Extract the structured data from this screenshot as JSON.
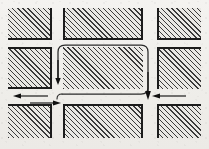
{
  "diagram": {
    "canvas": {
      "width": 209,
      "height": 149,
      "background_color": "#f1efec"
    },
    "style": {
      "hatch_color": "#3a3a3a",
      "block_fill_color": "#e9e8e4",
      "edge_color": "#1c1c1c",
      "path_color": "#2a2a2a",
      "hatch_angle_degrees": 45
    },
    "blocks": [
      {
        "id": "block-top-left",
        "label": "Top Left Block",
        "x": 8,
        "y": 8,
        "w": 44,
        "h": 32,
        "shadow_edges": "right-bottom"
      },
      {
        "id": "block-top-center",
        "label": "Top Center Block",
        "x": 63,
        "y": 8,
        "w": 80,
        "h": 32,
        "shadow_edges": "left-right-bottom"
      },
      {
        "id": "block-top-right",
        "label": "Top Right Block",
        "x": 157,
        "y": 8,
        "w": 44,
        "h": 32,
        "shadow_edges": "left-bottom"
      },
      {
        "id": "block-mid-left",
        "label": "Middle Left Block",
        "x": 8,
        "y": 47,
        "w": 44,
        "h": 42,
        "shadow_edges": "top-right-bottom"
      },
      {
        "id": "block-mid-center",
        "label": "Center Block",
        "x": 63,
        "y": 47,
        "w": 80,
        "h": 42,
        "shadow_edges": "none"
      },
      {
        "id": "block-mid-right",
        "label": "Middle Right Block",
        "x": 157,
        "y": 47,
        "w": 44,
        "h": 42,
        "shadow_edges": "left-top"
      },
      {
        "id": "block-bottom-left",
        "label": "Bottom Left Block",
        "x": 8,
        "y": 104,
        "w": 44,
        "h": 34,
        "shadow_edges": "top-right"
      },
      {
        "id": "block-bottom-center",
        "label": "Bottom Center Block",
        "x": 63,
        "y": 104,
        "w": 80,
        "h": 34,
        "shadow_edges": "left-top-right"
      },
      {
        "id": "block-bottom-right",
        "label": "Bottom Right Block",
        "x": 157,
        "y": 104,
        "w": 44,
        "h": 34,
        "shadow_edges": "left-top"
      }
    ],
    "loop_path": {
      "id": "routing-loop",
      "label": "Routing loop around centre block",
      "corner_radius": 7,
      "stroke_width": 1.3,
      "points_description": "Starts left of centre block, runs up, across the top, down the right side and back along the bottom."
    },
    "arrows": [
      {
        "id": "arrow-loop-down-left",
        "label": "Loop arrow pointing down (left side of centre block)",
        "direction": "down",
        "x": 58,
        "y": 78
      },
      {
        "id": "arrow-loop-down-right",
        "label": "Loop arrow pointing down (right side of centre block)",
        "direction": "down",
        "x": 147,
        "y": 95
      },
      {
        "id": "arrow-street-left-west",
        "label": "Street arrow pointing left (upper)",
        "direction": "left",
        "x": 20,
        "y": 95
      },
      {
        "id": "arrow-street-left-east",
        "label": "Street arrow pointing right (lower)",
        "direction": "right",
        "x": 56,
        "y": 101
      },
      {
        "id": "arrow-street-right-west",
        "label": "Street arrow pointing left (right street)",
        "direction": "left",
        "x": 163,
        "y": 95
      },
      {
        "id": "arrow-street-bottom-east",
        "label": "Street arrow pointing right (bottom street)",
        "direction": "right",
        "x": 56,
        "y": 101
      }
    ]
  }
}
